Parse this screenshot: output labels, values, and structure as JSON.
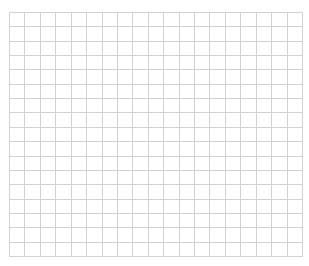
{
  "grid": {
    "columns": 19,
    "rows": 17,
    "origin_x": 9.5,
    "origin_y": 12.5,
    "width": 293,
    "height": 244,
    "line_color": "#d2d2d2",
    "background_color": "#ffffff"
  }
}
